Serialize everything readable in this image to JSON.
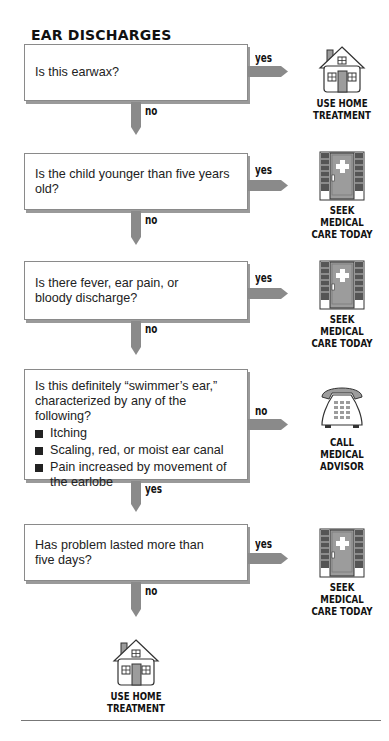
{
  "title": "EAR DISCHARGES",
  "colors": {
    "arrow": "#8a8a8a",
    "box_border": "#8a8a8a",
    "box_shadow": "#9a9a9a",
    "icon_fill": "#9c9c9c",
    "text": "#1a1a1a"
  },
  "steps": [
    {
      "question": "Is this earwax?",
      "bullets": [],
      "side_label": "yes",
      "down_label": "no",
      "outcome": {
        "icon": "house-icon",
        "lines": [
          "USE HOME",
          "TREATMENT"
        ]
      }
    },
    {
      "question": "Is the child younger than five years old?",
      "bullets": [],
      "side_label": "yes",
      "down_label": "no",
      "outcome": {
        "icon": "clinic-door-icon",
        "lines": [
          "SEEK",
          "MEDICAL",
          "CARE TODAY"
        ]
      }
    },
    {
      "question": "Is there fever, ear pain, or bloody discharge?",
      "bullets": [],
      "side_label": "yes",
      "down_label": "no",
      "outcome": {
        "icon": "clinic-door-icon",
        "lines": [
          "SEEK",
          "MEDICAL",
          "CARE TODAY"
        ]
      }
    },
    {
      "question": "Is this definitely “swimmer’s ear,” characterized by any of the following?",
      "bullets": [
        "Itching",
        "Scaling, red, or moist ear canal",
        "Pain increased by movement of the earlobe"
      ],
      "side_label": "no",
      "down_label": "yes",
      "outcome": {
        "icon": "telephone-icon",
        "lines": [
          "CALL",
          "MEDICAL",
          "ADVISOR"
        ]
      }
    },
    {
      "question": "Has problem lasted more than five days?",
      "bullets": [],
      "side_label": "yes",
      "down_label": "no",
      "outcome": {
        "icon": "clinic-door-icon",
        "lines": [
          "SEEK",
          "MEDICAL",
          "CARE TODAY"
        ]
      }
    }
  ],
  "final_outcome": {
    "icon": "house-icon",
    "lines": [
      "USE HOME",
      "TREATMENT"
    ]
  }
}
